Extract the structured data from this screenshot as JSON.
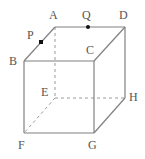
{
  "figure": {
    "name": "labeled-cube-with-points-p-and-q",
    "width": 145,
    "height": 159,
    "background_color": "#ffffff",
    "projection": "oblique",
    "solid_edge_color": "#808080",
    "hidden_edge_color": "#9a9a9a",
    "marker_color": "#111111",
    "label_color": "#555555",
    "solid_stroke_width": 1.2,
    "hidden_stroke_width": 1,
    "hidden_dash_pattern": "3 3"
  },
  "vertices": [
    {
      "id": "A",
      "label": "A",
      "x": 55,
      "y": 27,
      "hidden": false,
      "label_x": 49,
      "label_y": 9
    },
    {
      "id": "D",
      "label": "D",
      "x": 125,
      "y": 27,
      "hidden": false,
      "label_x": 119,
      "label_y": 9
    },
    {
      "id": "B",
      "label": "B",
      "x": 24,
      "y": 61,
      "hidden": false,
      "label_x": 9,
      "label_y": 55
    },
    {
      "id": "C",
      "label": "C",
      "x": 94,
      "y": 61,
      "hidden": false,
      "label_x": 86,
      "label_y": 44
    },
    {
      "id": "E",
      "label": "E",
      "x": 55,
      "y": 98,
      "hidden": true,
      "label_x": 41,
      "label_y": 86
    },
    {
      "id": "H",
      "label": "H",
      "x": 125,
      "y": 98,
      "hidden": false,
      "label_x": 129,
      "label_y": 91
    },
    {
      "id": "F",
      "label": "F",
      "x": 24,
      "y": 133,
      "hidden": false,
      "label_x": 18,
      "label_y": 139
    },
    {
      "id": "G",
      "label": "G",
      "x": 94,
      "y": 133,
      "hidden": false,
      "label_x": 88,
      "label_y": 139
    }
  ],
  "marked_points": [
    {
      "id": "P",
      "label": "P",
      "x": 41,
      "y": 42,
      "on_segment": "B-A",
      "marker": "square",
      "size": 4,
      "label_x": 27,
      "label_y": 29
    },
    {
      "id": "Q",
      "label": "Q",
      "x": 88,
      "y": 27,
      "on_segment": "A-D",
      "marker": "dot",
      "size": 4,
      "label_x": 82,
      "label_y": 9
    }
  ],
  "edges": [
    {
      "from": "A",
      "to": "D",
      "style": "solid",
      "name": "edge-a-d"
    },
    {
      "from": "A",
      "to": "B",
      "style": "solid",
      "name": "edge-a-b"
    },
    {
      "from": "D",
      "to": "C",
      "style": "solid",
      "name": "edge-d-c"
    },
    {
      "from": "D",
      "to": "H",
      "style": "solid",
      "name": "edge-d-h"
    },
    {
      "from": "B",
      "to": "C",
      "style": "solid",
      "name": "edge-b-c"
    },
    {
      "from": "B",
      "to": "F",
      "style": "solid",
      "name": "edge-b-f"
    },
    {
      "from": "C",
      "to": "G",
      "style": "solid",
      "name": "edge-c-g"
    },
    {
      "from": "F",
      "to": "G",
      "style": "solid",
      "name": "edge-f-g"
    },
    {
      "from": "G",
      "to": "H",
      "style": "solid",
      "name": "edge-g-h"
    },
    {
      "from": "A",
      "to": "E",
      "style": "dashed",
      "name": "edge-a-e-hidden"
    },
    {
      "from": "E",
      "to": "H",
      "style": "dashed",
      "name": "edge-e-h-hidden"
    },
    {
      "from": "E",
      "to": "F",
      "style": "dashed",
      "name": "edge-e-f-hidden"
    }
  ]
}
